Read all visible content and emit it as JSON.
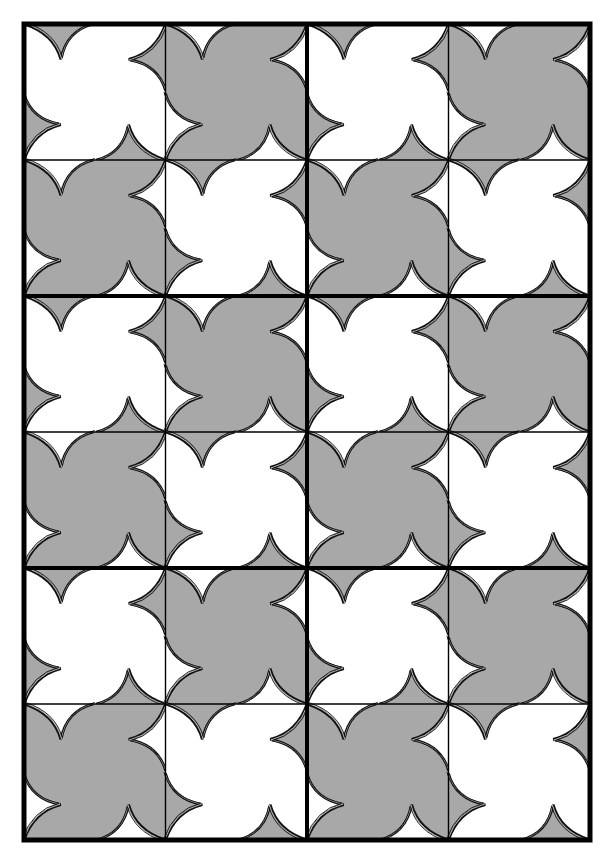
{
  "figure": {
    "kind": "tessellation-quilt",
    "size": {
      "width": 612,
      "height": 860
    }
  },
  "frame": {
    "x": 24,
    "y": 24,
    "width": 566,
    "height": 816,
    "outer_stroke": 5,
    "block_stroke": 4,
    "tile_stroke": 1.4,
    "color": "#000000"
  },
  "grid": {
    "block_cols": 2,
    "block_rows": 3,
    "tiles_per_block_x": 2,
    "tiles_per_block_y": 2,
    "tile_pattern": [
      [
        "white",
        "grey"
      ],
      [
        "grey",
        "white"
      ]
    ]
  },
  "colors": {
    "white": "#ffffff",
    "grey": "#a8a8a8",
    "outline": "#111111",
    "highlight": "#ffffff"
  },
  "cusp": {
    "unit": 100,
    "base_start": [
      0,
      0
    ],
    "base_end": [
      49,
      0
    ],
    "apex": [
      26,
      26
    ],
    "ctrl_right": [
      30,
      5
    ],
    "ctrl_left": [
      21,
      7
    ],
    "rotations": [
      0,
      90,
      180,
      270
    ]
  }
}
